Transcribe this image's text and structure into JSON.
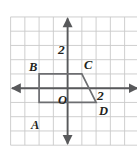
{
  "figure": {
    "background_color": "#ffffff",
    "grid_color": "#c9c9c9",
    "axis_color": "#58595b",
    "shape_color": "#6d6e71",
    "label_color": "#231f20"
  },
  "chart_data": {
    "type": "scatter",
    "title": "",
    "xlabel": "",
    "ylabel": "",
    "xlim": [
      -4,
      5
    ],
    "ylim": [
      -4,
      5
    ],
    "grid": true,
    "legend": "none",
    "grid_step": 1,
    "axis_tick_labels": {
      "y_axis": [
        {
          "value": 2,
          "text": "2"
        }
      ],
      "x_axis": [
        {
          "value": 2,
          "text": "2"
        }
      ],
      "origin": {
        "text": "O"
      }
    },
    "points": [
      {
        "name": "A",
        "x": -2,
        "y": -1,
        "label": "A",
        "label_pos": "below-left"
      },
      {
        "name": "B",
        "x": -2,
        "y": 1,
        "label": "B",
        "label_pos": "above-left"
      },
      {
        "name": "C",
        "x": 1,
        "y": 1,
        "label": "C",
        "label_pos": "above-right"
      },
      {
        "name": "D",
        "x": 2,
        "y": -1,
        "label": "D",
        "label_pos": "below-right"
      }
    ],
    "series": [
      {
        "name": "quadrilateral ABCD",
        "type": "polygon",
        "closed": true,
        "vertices": [
          [
            -2,
            -1
          ],
          [
            -2,
            1
          ],
          [
            1,
            1
          ],
          [
            2,
            -1
          ]
        ]
      }
    ],
    "annotations": [
      {
        "text": "2",
        "x": -0.55,
        "y": 2.2,
        "role": "y-axis-tick-label"
      },
      {
        "text": "2",
        "x": 2.15,
        "y": 0.45,
        "role": "x-axis-tick-label"
      },
      {
        "text": "O",
        "x": -0.6,
        "y": -0.55,
        "role": "origin-label"
      },
      {
        "text": "A",
        "x": -2.35,
        "y": -1.8,
        "role": "vertex-label"
      },
      {
        "text": "B",
        "x": -2.55,
        "y": 1.45,
        "role": "vertex-label"
      },
      {
        "text": "C",
        "x": 1.15,
        "y": 1.55,
        "role": "vertex-label"
      },
      {
        "text": "D",
        "x": 2.25,
        "y": -1.7,
        "role": "vertex-label"
      }
    ]
  }
}
